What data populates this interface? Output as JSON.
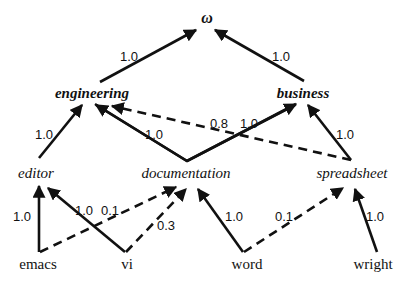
{
  "diagram": {
    "type": "weighted-hierarchy",
    "nodes": {
      "root": {
        "label": "ω",
        "x": 207,
        "y": 19
      },
      "engineering": {
        "label": "engineering",
        "x": 92,
        "y": 97
      },
      "business": {
        "label": "business",
        "x": 303,
        "y": 97
      },
      "editor": {
        "label": "editor",
        "x": 37,
        "y": 176
      },
      "documentation": {
        "label": "documentation",
        "x": 186,
        "y": 176
      },
      "spreadsheet": {
        "label": "spreadsheet",
        "x": 352,
        "y": 176
      },
      "emacs": {
        "label": "emacs",
        "x": 47,
        "y": 268
      },
      "vi": {
        "label": "vi",
        "x": 128,
        "y": 268
      },
      "word": {
        "label": "word",
        "x": 248,
        "y": 268
      },
      "wright": {
        "label": "wright",
        "x": 361,
        "y": 268
      }
    },
    "edges": [
      {
        "from": "engineering",
        "to": "root",
        "weight": "1.0",
        "style": "solid"
      },
      {
        "from": "business",
        "to": "root",
        "weight": "1.0",
        "style": "solid"
      },
      {
        "from": "editor",
        "to": "engineering",
        "weight": "1.0",
        "style": "solid"
      },
      {
        "from": "documentation",
        "to": "engineering",
        "weight": "1.0",
        "style": "solid"
      },
      {
        "from": "documentation",
        "to": "business",
        "weight": "1.0",
        "style": "solid"
      },
      {
        "from": "spreadsheet",
        "to": "engineering",
        "weight": "0.8",
        "style": "dashed"
      },
      {
        "from": "spreadsheet",
        "to": "business",
        "weight": "1.0",
        "style": "solid"
      },
      {
        "from": "emacs",
        "to": "editor",
        "weight": "1.0",
        "style": "solid"
      },
      {
        "from": "emacs",
        "to": "documentation",
        "weight": "0.1",
        "style": "dashed"
      },
      {
        "from": "vi",
        "to": "editor",
        "weight": "1.0",
        "style": "solid"
      },
      {
        "from": "vi",
        "to": "documentation",
        "weight": "0.3",
        "style": "dashed"
      },
      {
        "from": "word",
        "to": "documentation",
        "weight": "1.0",
        "style": "solid"
      },
      {
        "from": "word",
        "to": "spreadsheet",
        "weight": "0.1",
        "style": "dashed"
      },
      {
        "from": "wright",
        "to": "spreadsheet",
        "weight": "1.0",
        "style": "solid"
      }
    ],
    "edge_labels": {
      "engineering_root": "1.0",
      "business_root": "1.0",
      "editor_engineering": "1.0",
      "documentation_engineering": "1.0",
      "spreadsheet_engineering": "0.8",
      "documentation_business": "1.0",
      "spreadsheet_business": "1.0",
      "emacs_editor": "1.0",
      "vi_editor": "1.0",
      "emacs_documentation": "0.1",
      "vi_documentation": "0.3",
      "word_documentation": "1.0",
      "word_spreadsheet": "0.1",
      "wright_spreadsheet": "1.0"
    }
  }
}
